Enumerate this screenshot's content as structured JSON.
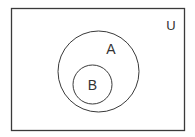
{
  "diagram": {
    "type": "venn",
    "universe": {
      "label": "U"
    },
    "sets": [
      {
        "id": "A",
        "label": "A"
      },
      {
        "id": "B",
        "label": "B",
        "subset_of": "A"
      }
    ],
    "colors": {
      "stroke": "#3a3a3a",
      "background": "#ffffff"
    }
  }
}
